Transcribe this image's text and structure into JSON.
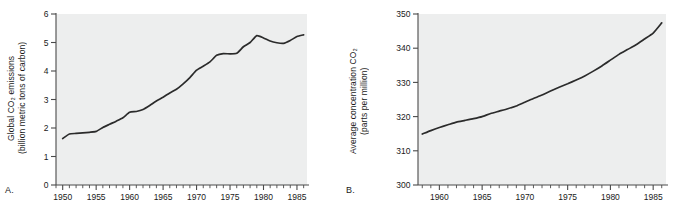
{
  "figure": {
    "panels": [
      {
        "id": "A",
        "label": "A.",
        "ytitle_line1": "Global CO₂ emissions",
        "ytitle_line2": "(billion metric tons of carbon)"
      },
      {
        "id": "B",
        "label": "B.",
        "ytitle_line1": "Average concentration CO₂",
        "ytitle_line2": "(parts per million)"
      }
    ]
  },
  "chart_data": [
    {
      "type": "line",
      "panel": "A",
      "title": "",
      "xlabel": "",
      "ylabel": "Global CO2 emissions (billion metric tons of carbon)",
      "ylabel_line1": "Global CO₂ emissions",
      "ylabel_line2": "(billion metric tons of carbon)",
      "xlim": [
        1949,
        1986.5
      ],
      "ylim": [
        0,
        6
      ],
      "grid": false,
      "legend": "none",
      "ytick_labels": [
        "0",
        "1",
        "2",
        "3",
        "4",
        "5",
        "6"
      ],
      "ytick_values": [
        0,
        1,
        2,
        3,
        4,
        5,
        6
      ],
      "xtick_labels": [
        "1950",
        "1955",
        "1960",
        "1965",
        "1970",
        "1975",
        "1980",
        "1985"
      ],
      "xtick_values": [
        1950,
        1955,
        1960,
        1965,
        1970,
        1975,
        1980,
        1985
      ],
      "xtick_minor_step": 1,
      "x": [
        1950,
        1951,
        1952,
        1953,
        1954,
        1955,
        1956,
        1957,
        1958,
        1959,
        1960,
        1961,
        1962,
        1963,
        1964,
        1965,
        1966,
        1967,
        1968,
        1969,
        1970,
        1971,
        1972,
        1973,
        1974,
        1975,
        1976,
        1977,
        1978,
        1979,
        1980,
        1981,
        1982,
        1983,
        1984,
        1985,
        1986
      ],
      "values": [
        1.63,
        1.79,
        1.81,
        1.83,
        1.85,
        1.88,
        2.02,
        2.13,
        2.24,
        2.36,
        2.55,
        2.58,
        2.65,
        2.79,
        2.95,
        3.08,
        3.23,
        3.36,
        3.55,
        3.77,
        4.03,
        4.17,
        4.32,
        4.55,
        4.61,
        4.6,
        4.62,
        4.85,
        5.0,
        5.24,
        5.16,
        5.05,
        4.99,
        4.97,
        5.07,
        5.21,
        5.27
      ],
      "series_name": "Global CO2 emissions"
    },
    {
      "type": "line",
      "panel": "B",
      "title": "",
      "xlabel": "",
      "ylabel": "Average concentration CO2 (parts per million)",
      "ylabel_line1": "Average concentration CO₂",
      "ylabel_line2": "(parts per million)",
      "xlim": [
        1957.5,
        1986.5
      ],
      "ylim": [
        300,
        350
      ],
      "grid": false,
      "legend": "none",
      "ytick_labels": [
        "300",
        "310",
        "320",
        "330",
        "340",
        "350"
      ],
      "ytick_values": [
        300,
        310,
        320,
        330,
        340,
        350
      ],
      "xtick_labels": [
        "1960",
        "1965",
        "1970",
        "1975",
        "1980",
        "1985"
      ],
      "xtick_values": [
        1960,
        1965,
        1970,
        1975,
        1980,
        1985
      ],
      "xtick_minor_step": 1,
      "x": [
        1958,
        1959,
        1960,
        1961,
        1962,
        1963,
        1964,
        1965,
        1966,
        1967,
        1968,
        1969,
        1970,
        1971,
        1972,
        1973,
        1974,
        1975,
        1976,
        1977,
        1978,
        1979,
        1980,
        1981,
        1982,
        1983,
        1984,
        1985,
        1986
      ],
      "values": [
        314.9,
        315.9,
        316.8,
        317.6,
        318.4,
        318.9,
        319.4,
        320.0,
        320.9,
        321.6,
        322.3,
        323.1,
        324.2,
        325.3,
        326.3,
        327.5,
        328.6,
        329.6,
        330.7,
        331.9,
        333.3,
        334.8,
        336.5,
        338.2,
        339.6,
        341.0,
        342.7,
        344.4,
        347.4
      ],
      "series_name": "Average CO2 concentration"
    }
  ]
}
